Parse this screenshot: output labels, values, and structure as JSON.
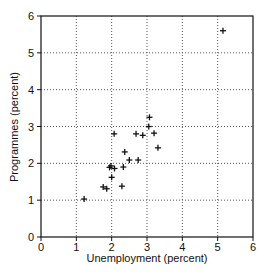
{
  "chart_data": {
    "type": "scatter",
    "title": "",
    "xlabel": "Unemployment (percent)",
    "ylabel": "Programmes (percent)",
    "xlim": [
      0,
      6
    ],
    "ylim": [
      0,
      6
    ],
    "xticks": [
      "0",
      "1",
      "2",
      "3",
      "4",
      "5",
      "6"
    ],
    "yticks": [
      "0",
      "1",
      "2",
      "3",
      "4",
      "5",
      "6"
    ],
    "grid": "dotted",
    "marker": "+",
    "series": [
      {
        "name": "countries",
        "points": [
          {
            "x": 1.22,
            "y": 1.03
          },
          {
            "x": 1.76,
            "y": 1.36
          },
          {
            "x": 1.86,
            "y": 1.31
          },
          {
            "x": 1.94,
            "y": 1.89
          },
          {
            "x": 1.98,
            "y": 1.93
          },
          {
            "x": 2.0,
            "y": 1.62
          },
          {
            "x": 2.08,
            "y": 1.86
          },
          {
            "x": 2.07,
            "y": 2.8
          },
          {
            "x": 2.29,
            "y": 1.38
          },
          {
            "x": 2.33,
            "y": 1.9
          },
          {
            "x": 2.37,
            "y": 2.31
          },
          {
            "x": 2.5,
            "y": 2.09
          },
          {
            "x": 2.69,
            "y": 2.8
          },
          {
            "x": 2.75,
            "y": 2.09
          },
          {
            "x": 2.88,
            "y": 2.76
          },
          {
            "x": 3.05,
            "y": 3.0
          },
          {
            "x": 3.07,
            "y": 3.25
          },
          {
            "x": 3.2,
            "y": 2.82
          },
          {
            "x": 3.31,
            "y": 2.42
          },
          {
            "x": 5.15,
            "y": 5.6
          }
        ]
      }
    ]
  }
}
